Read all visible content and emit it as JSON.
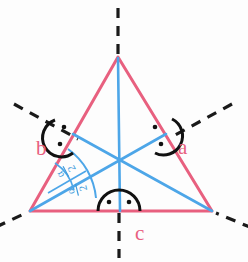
{
  "figure": {
    "colors": {
      "triangle_stroke": "#e8607f",
      "bisector_stroke": "#4da6e8",
      "axis_stroke": "#1a1a1a",
      "arc_stroke": "#111111",
      "fraction_label": "#3f9bdc",
      "vertex_label": "#e8607f",
      "background": "#fdfdfd"
    },
    "geometry": {
      "apex": [
        118,
        57
      ],
      "bottom_left": [
        30,
        211
      ],
      "bottom_right": [
        212,
        211
      ],
      "incenter": [
        118,
        158
      ],
      "midpoint_left_side": [
        74,
        134
      ],
      "midpoint_right_side": [
        165,
        134
      ],
      "midpoint_base": [
        121,
        211
      ]
    }
  },
  "labels": {
    "vertex_left": "b",
    "vertex_right": "a",
    "vertex_bottom": "c",
    "half_angle_numerator": "α",
    "half_angle_denominator": "2",
    "half_angle_bar": "—"
  },
  "label_positions": {
    "vertex_left": [
      36,
      155
    ],
    "vertex_right": [
      178,
      154
    ],
    "vertex_bottom": [
      135,
      240
    ]
  },
  "angle_marks": [
    {
      "name": "angle-mark-vertex-left",
      "cx": 64,
      "cy": 137,
      "r": 18,
      "dots": 2
    },
    {
      "name": "angle-mark-vertex-right",
      "cx": 163,
      "cy": 136,
      "r": 18,
      "dots": 2
    },
    {
      "name": "angle-mark-vertex-bottom",
      "cx": 118,
      "cy": 211,
      "r": 20,
      "dots": 2
    }
  ],
  "half_angle_arcs": [
    {
      "name": "half-angle-arc-upper",
      "label": "α/2"
    },
    {
      "name": "half-angle-arc-lower",
      "label": "α/2"
    }
  ],
  "symmetry_axes": [
    {
      "name": "symmetry-axis-vertical",
      "through": "apex"
    },
    {
      "name": "symmetry-axis-left-diagonal",
      "through": "bottom-left"
    },
    {
      "name": "symmetry-axis-right-diagonal",
      "through": "bottom-right"
    }
  ]
}
